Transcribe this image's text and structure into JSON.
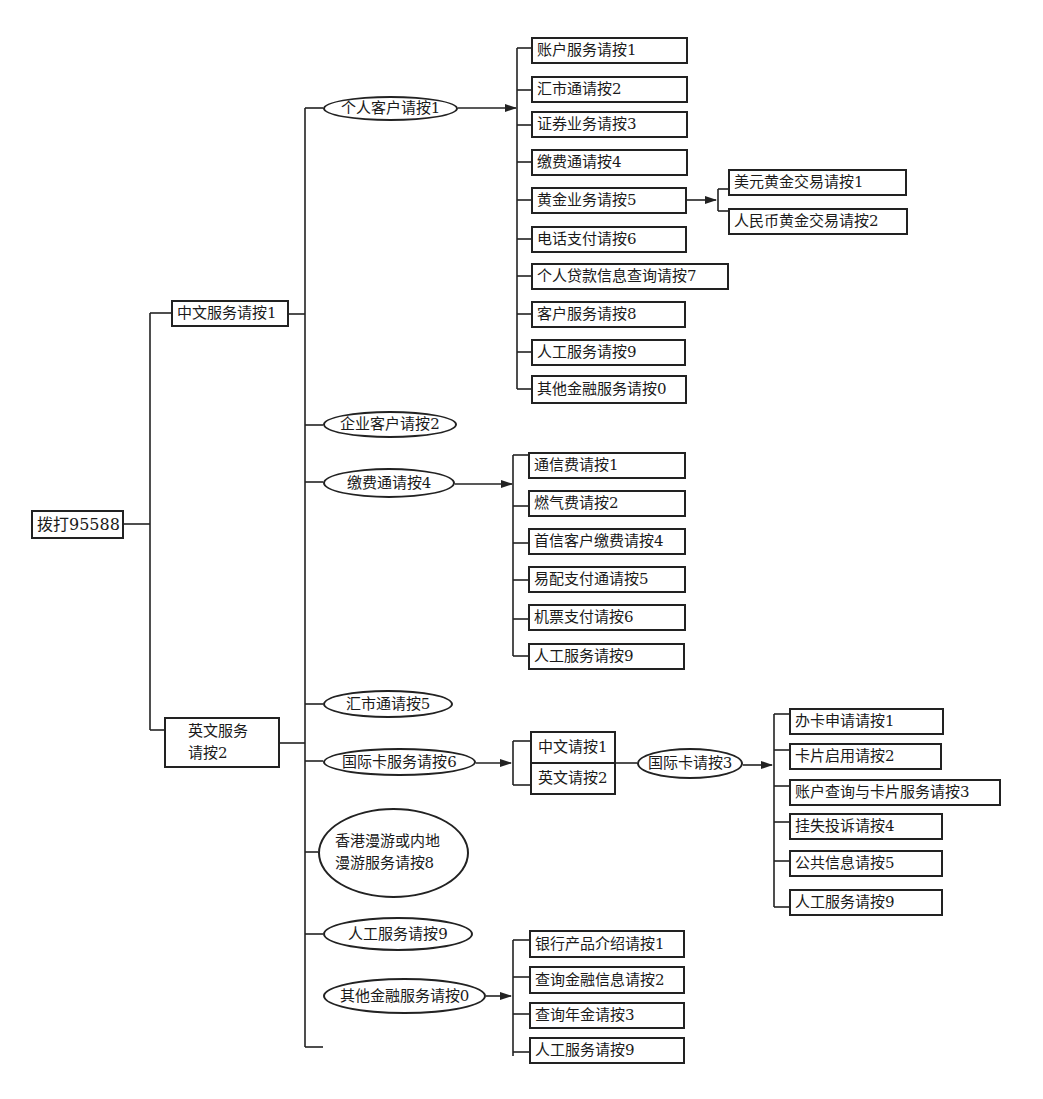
{
  "diagram": {
    "type": "ivr-menu-tree",
    "root": {
      "label": "拨打95588"
    },
    "level1": [
      {
        "label": "中文服务请按1"
      },
      {
        "label": "英文服务请按2"
      }
    ],
    "chinese_menu": [
      {
        "label": "个人客户请按1"
      },
      {
        "label": "企业客户请按2"
      },
      {
        "label": "缴费通请按4"
      },
      {
        "label": "汇市通请按5"
      },
      {
        "label": "国际卡服务请按6"
      },
      {
        "label": "香港漫游或内地漫游服务请按8"
      },
      {
        "label": "人工服务请按9"
      },
      {
        "label": "其他金融服务请按0"
      }
    ],
    "personal_customer": [
      {
        "label": "账户服务请按1"
      },
      {
        "label": "汇市通请按2"
      },
      {
        "label": "证券业务请按3"
      },
      {
        "label": "缴费通请按4"
      },
      {
        "label": "黄金业务请按5"
      },
      {
        "label": "电话支付请按6"
      },
      {
        "label": "个人贷款信息查询请按7"
      },
      {
        "label": "客户服务请按8"
      },
      {
        "label": "人工服务请按9"
      },
      {
        "label": "其他金融服务请按0"
      }
    ],
    "gold_business": [
      {
        "label": "美元黄金交易请按1"
      },
      {
        "label": "人民币黄金交易请按2"
      }
    ],
    "payment": [
      {
        "label": "通信费请按1"
      },
      {
        "label": "燃气费请按2"
      },
      {
        "label": "首信客户缴费请按4"
      },
      {
        "label": "易配支付通请按5"
      },
      {
        "label": "机票支付请按6"
      },
      {
        "label": "人工服务请按9"
      }
    ],
    "intl_card_language": [
      {
        "label": "中文请按1"
      },
      {
        "label": "英文请按2"
      }
    ],
    "intl_card_node": {
      "label": "国际卡请按3"
    },
    "intl_card": [
      {
        "label": "办卡申请请按1"
      },
      {
        "label": "卡片启用请按2"
      },
      {
        "label": "账户查询与卡片服务请按3"
      },
      {
        "label": "挂失投诉请按4"
      },
      {
        "label": "公共信息请按5"
      },
      {
        "label": "人工服务请按9"
      }
    ],
    "other_financial": [
      {
        "label": "银行产品介绍请按1"
      },
      {
        "label": "查询金融信息请按2"
      },
      {
        "label": "查询年金请按3"
      },
      {
        "label": "人工服务请按9"
      }
    ]
  }
}
